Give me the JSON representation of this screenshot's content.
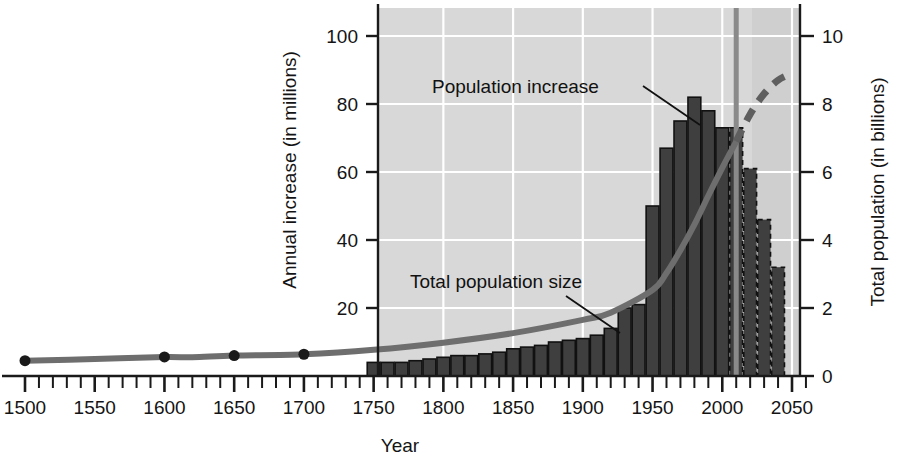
{
  "chart_data": {
    "type": "bar",
    "title": "",
    "xlabel": "Year",
    "ylabel": "Annual increase (in millions)",
    "y2label": "Total population (in billions)",
    "xlim": [
      1500,
      2060
    ],
    "ylim": [
      0,
      107
    ],
    "y2lim": [
      0,
      10.7
    ],
    "grid": true,
    "legend_position": "inline-annotations",
    "x_ticks_major": [
      1500,
      1550,
      1600,
      1650,
      1700,
      1750,
      1800,
      1850,
      1900,
      1950,
      2000,
      2050
    ],
    "x_ticks_minor_step": 10,
    "y_ticks_left": [
      20,
      40,
      60,
      80,
      100
    ],
    "y_ticks_right": [
      0,
      2,
      4,
      6,
      8,
      10
    ],
    "annotations": [
      {
        "text": "Population increase",
        "x": 1900,
        "y": 88
      },
      {
        "text": "Total population size",
        "x": 1848,
        "y": 30
      }
    ],
    "present_year_marker": 2010,
    "bars": {
      "name": "Annual population increase (millions)",
      "unit": "millions per year",
      "bar_width_years": 10,
      "categories": [
        1750,
        1760,
        1770,
        1780,
        1790,
        1800,
        1810,
        1820,
        1830,
        1840,
        1850,
        1860,
        1870,
        1880,
        1890,
        1900,
        1910,
        1920,
        1930,
        1940,
        1950,
        1960,
        1970,
        1980,
        1990,
        2000,
        2010,
        2020,
        2030,
        2040
      ],
      "values": [
        4,
        4,
        4,
        4.5,
        5,
        5.5,
        6,
        6,
        6.5,
        7,
        8,
        8.5,
        9,
        10,
        10.5,
        11,
        12,
        14,
        20,
        21,
        50,
        67,
        75,
        82,
        78,
        73,
        73,
        61,
        46,
        32
      ],
      "projected_from": 2010,
      "peak": {
        "year": 1980,
        "value": 82
      }
    },
    "line": {
      "name": "Total world population (billions)",
      "unit": "billions",
      "x": [
        1500,
        1550,
        1600,
        1620,
        1650,
        1700,
        1750,
        1800,
        1850,
        1900,
        1920,
        1950,
        1960,
        1970,
        1980,
        1990,
        2000,
        2010,
        2020,
        2030,
        2040,
        2050
      ],
      "values": [
        0.45,
        0.5,
        0.56,
        0.55,
        0.6,
        0.64,
        0.77,
        0.98,
        1.26,
        1.65,
        1.86,
        2.53,
        3.03,
        3.7,
        4.45,
        5.3,
        6.12,
        6.9,
        7.7,
        8.3,
        8.7,
        8.9
      ],
      "markers_at": [
        1500,
        1600,
        1650,
        1700
      ],
      "projected_from": 2010
    }
  },
  "colors": {
    "plot_background": "#d8d8d8",
    "gridline": "#ffffff",
    "bar_fill": "#3f3f3f",
    "bar_outline": "#111111",
    "curve": "#6e6e6e",
    "present_line": "#8a8a8a",
    "axis": "#1a1a1a",
    "text": "#141414"
  }
}
